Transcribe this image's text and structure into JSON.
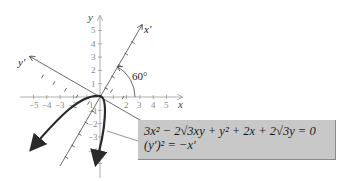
{
  "diagram": {
    "axes": {
      "x_label": "x",
      "y_label": "y",
      "x_prime_label": "x′",
      "y_prime_label": "y′",
      "x_ticks": [
        "−5",
        "−4",
        "−3",
        "−2",
        "1",
        "2",
        "3",
        "4",
        "5"
      ],
      "y_ticks": [
        "5",
        "4",
        "3",
        "2",
        "1",
        "−1",
        "−2",
        "−3",
        "−4"
      ]
    },
    "rotation_angle_label": "60°",
    "equation_box": {
      "line1": "3x² − 2√3xy + y² + 2x + 2√3y = 0",
      "line2": "(y′)² = −x′"
    },
    "colors": {
      "axis": "#999999",
      "rotated_axis": "#444444",
      "curve": "#2a2a2a",
      "box_fill": "#c8c8c8"
    }
  }
}
